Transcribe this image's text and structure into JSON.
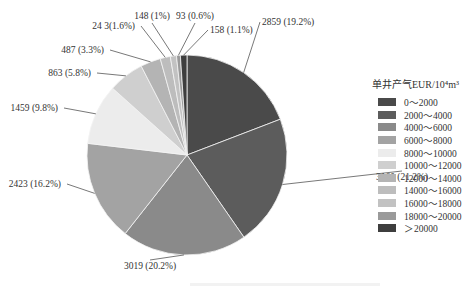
{
  "chart_data": {
    "type": "pie",
    "title": "",
    "legend_title": "单井产气EUR/10⁴m³",
    "legend_position": "right",
    "categories": [
      "0～2000",
      "2000～4000",
      "4000～6000",
      "6000～8000",
      "8000～10000",
      "10000～12000",
      "12000～14000",
      "14000～16000",
      "16000～18000",
      "18000～20000",
      "＞20000"
    ],
    "values": [
      2859,
      3160,
      3019,
      2423,
      1459,
      863,
      487,
      243,
      148,
      93,
      158
    ],
    "percentages": [
      19.2,
      21.2,
      20.2,
      16.2,
      9.8,
      5.8,
      3.3,
      1.6,
      1.0,
      0.6,
      1.1
    ],
    "labels": [
      "2859 (19.2%)",
      "3160 (21.2%)",
      "3019 (20.2%)",
      "2423 (16.2%)",
      "1459 (9.8%)",
      "863 (5.8%)",
      "487 (3.3%)",
      "24 3(1.6%)",
      "148 (1%)",
      "93 (0.6%)",
      "158 (1.1%)"
    ],
    "colors": [
      "#4a4a4a",
      "#5c5c5c",
      "#8a8a8a",
      "#a3a3a3",
      "#ececec",
      "#cfcfcf",
      "#b4b4b4",
      "#bdbdbd",
      "#c2c2c2",
      "#9a9a9a",
      "#3e3e3e"
    ],
    "start_angle_deg": 0,
    "direction": "clockwise"
  },
  "legend": {
    "title": "单井产气EUR/10⁴m³",
    "items": [
      "0～2000",
      "2000～4000",
      "4000～6000",
      "6000～8000",
      "8000～10000",
      "10000～12000",
      "12000～14000",
      "14000～16000",
      "16000～18000",
      "18000～20000",
      "＞20000"
    ]
  }
}
